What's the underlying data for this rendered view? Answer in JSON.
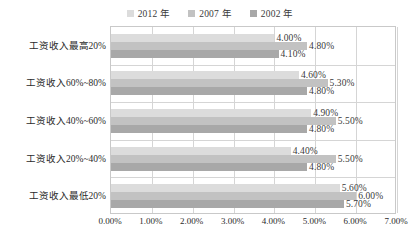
{
  "chart_data": {
    "type": "bar",
    "orientation": "horizontal",
    "title": "",
    "xlabel": "",
    "ylabel": "",
    "xlim": [
      0,
      7
    ],
    "xtick_labels": [
      "0.00%",
      "1.00%",
      "2.00%",
      "3.00%",
      "4.00%",
      "5.00%",
      "6.00%",
      "7.00%"
    ],
    "xtick_values": [
      0,
      1,
      2,
      3,
      4,
      5,
      6,
      7
    ],
    "grid": true,
    "legend_position": "top-center",
    "categories": [
      "工资收入最高20%",
      "工资收入60%~80%",
      "工资收入40%~60%",
      "工资收入20%~40%",
      "工资收入最低20%"
    ],
    "series": [
      {
        "name": "2012 年",
        "color": "#dcdcdc",
        "values": [
          4.0,
          4.6,
          4.9,
          4.4,
          5.6
        ],
        "labels": [
          "4.00%",
          "4.60%",
          "4.90%",
          "4.40%",
          "5.60%"
        ]
      },
      {
        "name": "2007 年",
        "color": "#c2c2c2",
        "values": [
          4.8,
          5.3,
          5.5,
          5.5,
          6.0
        ],
        "labels": [
          "4.80%",
          "5.30%",
          "5.50%",
          "5.50%",
          "6.00%"
        ]
      },
      {
        "name": "2002 年",
        "color": "#a8a8a8",
        "values": [
          4.1,
          4.8,
          4.8,
          4.8,
          5.7
        ],
        "labels": [
          "4.10%",
          "4.80%",
          "4.80%",
          "4.80%",
          "5.70%"
        ]
      }
    ]
  },
  "legend": {
    "items": [
      {
        "label": "2012 年",
        "color": "#dcdcdc"
      },
      {
        "label": "2007 年",
        "color": "#c2c2c2"
      },
      {
        "label": "2002 年",
        "color": "#a8a8a8"
      }
    ]
  },
  "axis": {
    "x_ticks": [
      "0.00%",
      "1.00%",
      "2.00%",
      "3.00%",
      "4.00%",
      "5.00%",
      "6.00%",
      "7.00%"
    ]
  },
  "colors": {
    "grid": "#d5d5d5",
    "frame": "#c9c9c9",
    "text": "#2b2b2b",
    "background": "#ffffff"
  }
}
